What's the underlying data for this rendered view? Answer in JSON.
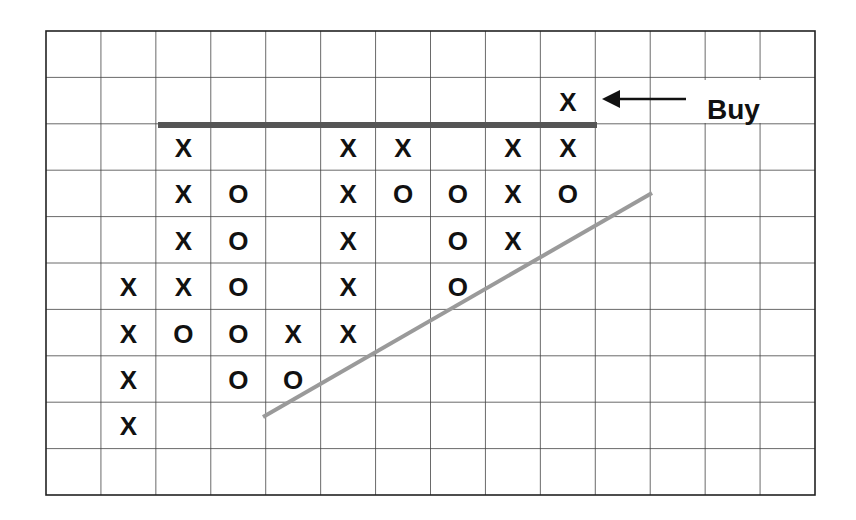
{
  "chart_data": {
    "type": "point-and-figure",
    "title": "",
    "xlabel": "",
    "ylabel": "",
    "grid": {
      "columns": 14,
      "rows": 10,
      "on": true
    },
    "columns": [
      {
        "col": 1,
        "type": "X",
        "rows": [
          5,
          6,
          7,
          8
        ]
      },
      {
        "col": 2,
        "type": "X",
        "rows": [
          2,
          3,
          4,
          5
        ]
      },
      {
        "col": 2,
        "type": "O",
        "rows": [
          6
        ]
      },
      {
        "col": 3,
        "type": "O",
        "rows": [
          3,
          4,
          5,
          6,
          7
        ]
      },
      {
        "col": 4,
        "type": "X",
        "rows": [
          6
        ]
      },
      {
        "col": 4,
        "type": "O",
        "rows": [
          7
        ]
      },
      {
        "col": 5,
        "type": "X",
        "rows": [
          2,
          3,
          4,
          5,
          6
        ]
      },
      {
        "col": 6,
        "type": "X",
        "rows": [
          2
        ]
      },
      {
        "col": 6,
        "type": "O",
        "rows": [
          3
        ]
      },
      {
        "col": 7,
        "type": "O",
        "rows": [
          3,
          4,
          5
        ]
      },
      {
        "col": 8,
        "type": "X",
        "rows": [
          2,
          3,
          4
        ]
      },
      {
        "col": 9,
        "type": "X",
        "rows": [
          1,
          2
        ]
      },
      {
        "col": 9,
        "type": "O",
        "rows": [
          3
        ]
      }
    ],
    "cells": [
      {
        "r": 1,
        "c": 9,
        "v": "X"
      },
      {
        "r": 2,
        "c": 2,
        "v": "X"
      },
      {
        "r": 2,
        "c": 5,
        "v": "X"
      },
      {
        "r": 2,
        "c": 6,
        "v": "X"
      },
      {
        "r": 2,
        "c": 8,
        "v": "X"
      },
      {
        "r": 2,
        "c": 9,
        "v": "X"
      },
      {
        "r": 3,
        "c": 2,
        "v": "X"
      },
      {
        "r": 3,
        "c": 3,
        "v": "O"
      },
      {
        "r": 3,
        "c": 5,
        "v": "X"
      },
      {
        "r": 3,
        "c": 6,
        "v": "O"
      },
      {
        "r": 3,
        "c": 7,
        "v": "O"
      },
      {
        "r": 3,
        "c": 8,
        "v": "X"
      },
      {
        "r": 3,
        "c": 9,
        "v": "O"
      },
      {
        "r": 4,
        "c": 2,
        "v": "X"
      },
      {
        "r": 4,
        "c": 3,
        "v": "O"
      },
      {
        "r": 4,
        "c": 5,
        "v": "X"
      },
      {
        "r": 4,
        "c": 7,
        "v": "O"
      },
      {
        "r": 4,
        "c": 8,
        "v": "X"
      },
      {
        "r": 5,
        "c": 1,
        "v": "X"
      },
      {
        "r": 5,
        "c": 2,
        "v": "X"
      },
      {
        "r": 5,
        "c": 3,
        "v": "O"
      },
      {
        "r": 5,
        "c": 5,
        "v": "X"
      },
      {
        "r": 5,
        "c": 7,
        "v": "O"
      },
      {
        "r": 6,
        "c": 1,
        "v": "X"
      },
      {
        "r": 6,
        "c": 2,
        "v": "O"
      },
      {
        "r": 6,
        "c": 3,
        "v": "O"
      },
      {
        "r": 6,
        "c": 4,
        "v": "X"
      },
      {
        "r": 6,
        "c": 5,
        "v": "X"
      },
      {
        "r": 7,
        "c": 1,
        "v": "X"
      },
      {
        "r": 7,
        "c": 3,
        "v": "O"
      },
      {
        "r": 7,
        "c": 4,
        "v": "O"
      },
      {
        "r": 8,
        "c": 1,
        "v": "X"
      }
    ],
    "resistance_line": {
      "row_boundary": 2,
      "from_col": 2,
      "to_col": 9,
      "color": "#555555"
    },
    "trendline": {
      "from": [
        263,
        417
      ],
      "to": [
        652,
        193
      ],
      "color": "#999999"
    },
    "annotations": [
      {
        "text": "Buy",
        "arrow_to": {
          "r": 1,
          "c": 9
        }
      }
    ]
  },
  "labels": {
    "buy": "Buy"
  },
  "colors": {
    "grid": "#444444",
    "border": "#222222",
    "resistance": "#555555",
    "trend": "#9a9a9a",
    "mark": "#111111"
  }
}
